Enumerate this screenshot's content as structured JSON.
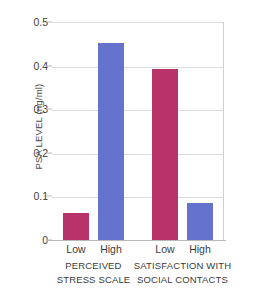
{
  "chart_data": {
    "type": "bar",
    "title": "",
    "xlabel": "",
    "ylabel": "PSA LEVEL (ng/ml)",
    "ylim": [
      0,
      0.5
    ],
    "ytick_labels": [
      "0.5",
      "0.4",
      "0.3",
      "0.2",
      "0.1",
      "0"
    ],
    "ytick_values": [
      0.5,
      0.4,
      0.3,
      0.2,
      0.1,
      0
    ],
    "grid": "horizontal",
    "legend": "none",
    "categories": [
      "Low",
      "High",
      "Low",
      "High"
    ],
    "values": [
      0.062,
      0.452,
      0.392,
      0.085
    ],
    "bar_colors": [
      "#b8336a",
      "#6573cc",
      "#b8336a",
      "#6573cc"
    ],
    "groups": [
      {
        "line1": "PERCEIVED",
        "line2": "STRESS SCALE",
        "categories": [
          "Low",
          "High"
        ],
        "values": [
          0.062,
          0.452
        ]
      },
      {
        "line1": "SATISFACTION WITH",
        "line2": "SOCIAL CONTACTS",
        "categories": [
          "Low",
          "High"
        ],
        "values": [
          0.392,
          0.085
        ]
      }
    ],
    "bars": [
      {
        "label": "Low",
        "group": "PERCEIVED STRESS SCALE",
        "value": 0.062,
        "color": "#b8336a"
      },
      {
        "label": "High",
        "group": "PERCEIVED STRESS SCALE",
        "value": 0.452,
        "color": "#6573cc"
      },
      {
        "label": "Low",
        "group": "SATISFACTION WITH SOCIAL CONTACTS",
        "value": 0.392,
        "color": "#b8336a"
      },
      {
        "label": "High",
        "group": "SATISFACTION WITH SOCIAL CONTACTS",
        "value": 0.085,
        "color": "#6573cc"
      }
    ],
    "colors": {
      "magenta": "#b8336a",
      "blue": "#6573cc",
      "gridline": "#dddddd",
      "axis": "#b9b9b9",
      "text": "#3c3c3c",
      "background": "#ffffff"
    }
  }
}
